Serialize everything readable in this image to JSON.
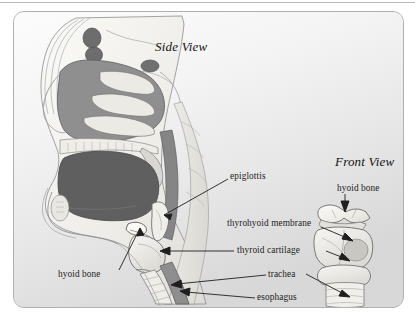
{
  "figure": {
    "background_top_color": "#fbfbfb",
    "background_bottom_color": "#dadada",
    "border_color": "#b0b0b0",
    "ink_color": "#1d1d1d"
  },
  "views": [
    {
      "id": "side",
      "title": "Side View"
    },
    {
      "id": "front",
      "title": "Front View"
    }
  ],
  "labels": [
    {
      "id": "epiglottis",
      "text": "epiglottis",
      "view": "side",
      "leader": "line-down-left"
    },
    {
      "id": "thyrohyoid_membrane",
      "text": "thyrohyoid membrane",
      "view": "front",
      "leader": "arrow-down-right"
    },
    {
      "id": "thyroid_cartilage",
      "text": "thyroid cartilage",
      "view": "both",
      "leader": "line-left-and-arrow-right"
    },
    {
      "id": "trachea",
      "text": "trachea",
      "view": "both",
      "leader": "arrow-left-and-arrow-right"
    },
    {
      "id": "esophagus",
      "text": "esophagus",
      "view": "side",
      "leader": "arrow-left"
    },
    {
      "id": "hyoid_bone_side",
      "text": "hyoid bone",
      "view": "side",
      "leader": "line-up-right"
    },
    {
      "id": "hyoid_bone_front",
      "text": "hyoid bone",
      "view": "front",
      "leader": "arrow-down"
    }
  ],
  "anatomy": {
    "side_view_structures": [
      "skull",
      "nasal cavity",
      "nasal turbinates",
      "hard palate",
      "soft palate",
      "tongue",
      "mandible",
      "oral cavity",
      "pharynx",
      "epiglottis",
      "hyoid bone",
      "thyroid cartilage",
      "trachea",
      "esophagus",
      "cervical spine"
    ],
    "front_view_structures": [
      "hyoid bone",
      "thyrohyoid membrane",
      "thyroid cartilage",
      "cricoid cartilage",
      "trachea"
    ]
  },
  "palette": {
    "bone_light": "#f2f0ec",
    "cartilage": "#e8e6e1",
    "tissue_mid": "#9a9a9a",
    "tissue_dark": "#6f6f6f",
    "tissue_darkest": "#585858",
    "outline": "#4a4a4a"
  }
}
